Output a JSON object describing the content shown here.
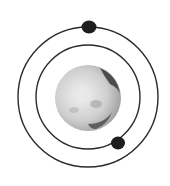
{
  "diagram": {
    "type": "orbital-system",
    "planet": {
      "cx": 88,
      "cy": 98,
      "r": 33,
      "fill": "#d9d9d9",
      "shade": "#3a3a3a"
    },
    "orbits": [
      {
        "name": "inner-orbit",
        "cx": 88,
        "cy": 97,
        "r": 52,
        "stroke": "#2a2a2a"
      },
      {
        "name": "outer-orbit",
        "cx": 88,
        "cy": 97,
        "r": 70,
        "stroke": "#2a2a2a"
      }
    ],
    "satellites": [
      {
        "name": "outer-satellite",
        "cx": 89,
        "cy": 27,
        "r": 7,
        "fill": "#1e1e1e"
      },
      {
        "name": "inner-satellite",
        "cx": 118,
        "cy": 143,
        "r": 7,
        "fill": "#1e1e1e"
      }
    ]
  }
}
